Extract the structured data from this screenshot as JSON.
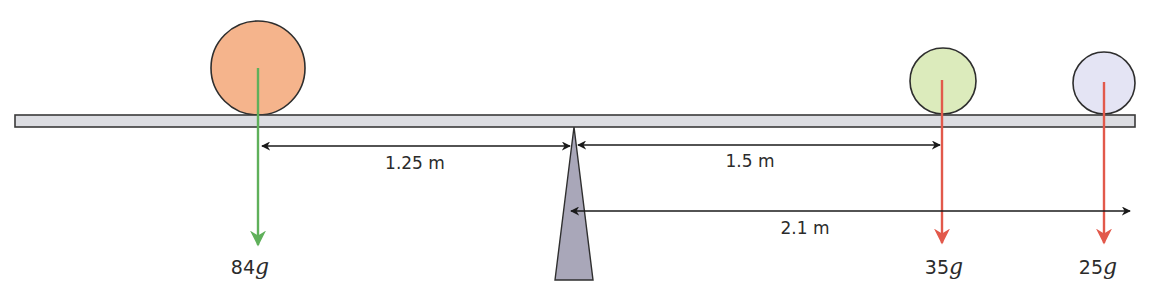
{
  "diagram": {
    "type": "lever-moment-diagram",
    "beam": {
      "fill": "#dcdde2",
      "stroke": "#3a3a3a"
    },
    "pivot": {
      "fill": "#a9a7b9",
      "stroke": "#2f2f2f"
    },
    "masses": [
      {
        "id": "left-mass",
        "color": "#f5b48c",
        "arrow_color": "#5fb05a",
        "force_value": "84",
        "force_unit": "g"
      },
      {
        "id": "middle-mass",
        "color": "#dcebbc",
        "arrow_color": "#e2594b",
        "force_value": "35",
        "force_unit": "g"
      },
      {
        "id": "right-mass",
        "color": "#e4e4f4",
        "arrow_color": "#e2594b",
        "force_value": "25",
        "force_unit": "g"
      }
    ],
    "dimensions": [
      {
        "id": "left-distance",
        "label": "1.25 m"
      },
      {
        "id": "middle-distance",
        "label": "1.5 m"
      },
      {
        "id": "right-distance",
        "label": "2.1 m"
      }
    ]
  }
}
